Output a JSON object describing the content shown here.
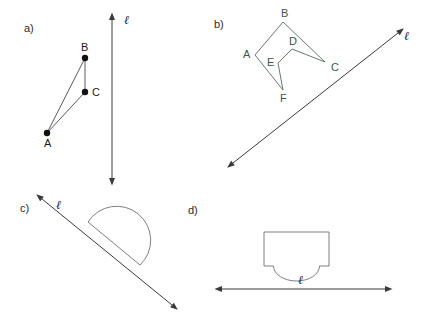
{
  "figure": {
    "background_color": "#ffffff",
    "width": 422,
    "height": 327
  },
  "panels": [
    {
      "id": "a",
      "label": "a)",
      "label_pos": [
        24,
        32
      ],
      "line": {
        "name": "line-ell-a",
        "label": "ℓ",
        "label_pos": [
          124,
          24
        ],
        "orientation": "vertical",
        "x1": 112,
        "y1": 20,
        "x2": 112,
        "y2": 178,
        "double_headed": true
      },
      "shape": {
        "name": "triangle-abc",
        "type": "triangle",
        "vertices": [
          {
            "name": "A",
            "x": 47,
            "y": 133,
            "label_dx": -3,
            "label_dy": 14
          },
          {
            "name": "B",
            "x": 85,
            "y": 58,
            "label_dx": -4,
            "label_dy": -7
          },
          {
            "name": "C",
            "x": 85,
            "y": 92,
            "label_dx": 7,
            "label_dy": 4
          }
        ],
        "edges": [
          [
            "A",
            "B"
          ],
          [
            "B",
            "C"
          ],
          [
            "C",
            "A"
          ]
        ],
        "dot_radius": 3.2
      }
    },
    {
      "id": "b",
      "label": "b)",
      "label_pos": [
        214,
        28
      ],
      "line": {
        "name": "line-ell-b",
        "label": "ℓ",
        "label_pos": [
          404,
          40
        ],
        "orientation": "diagonal-up-right",
        "x1": 233,
        "y1": 163,
        "x2": 398,
        "y2": 33,
        "double_headed": true
      },
      "shape": {
        "name": "hexagon-abcdef",
        "type": "concave-hexagon",
        "vertices": [
          {
            "name": "A",
            "x": 255,
            "y": 55,
            "label_dx": -12,
            "label_dy": 3
          },
          {
            "name": "B",
            "x": 283,
            "y": 22,
            "label_dx": -2,
            "label_dy": -5
          },
          {
            "name": "C",
            "x": 325,
            "y": 62,
            "label_dx": 6,
            "label_dy": 9
          },
          {
            "name": "D",
            "x": 292,
            "y": 49,
            "label_dx": -3,
            "label_dy": -4
          },
          {
            "name": "E",
            "x": 278,
            "y": 63,
            "label_dx": -11,
            "label_dy": 3
          },
          {
            "name": "F",
            "x": 283,
            "y": 90,
            "label_dx": -3,
            "label_dy": 12
          }
        ],
        "edges": [
          [
            "A",
            "B"
          ],
          [
            "B",
            "C"
          ],
          [
            "C",
            "D"
          ],
          [
            "D",
            "E"
          ],
          [
            "E",
            "F"
          ],
          [
            "F",
            "A"
          ]
        ]
      }
    },
    {
      "id": "c",
      "label": "c)",
      "label_pos": [
        20,
        208
      ],
      "line": {
        "name": "line-ell-c",
        "label": "ℓ",
        "label_pos": [
          56,
          207
        ],
        "orientation": "diagonal-down-right",
        "x1": 42,
        "y1": 199,
        "x2": 172,
        "y2": 305,
        "double_headed": true
      },
      "shape": {
        "name": "half-disk",
        "type": "semicircle",
        "diameter_start": [
          88,
          222
        ],
        "diameter_end": [
          140,
          265
        ],
        "bulge_side": "upper-right"
      }
    },
    {
      "id": "d",
      "label": "d)",
      "label_pos": [
        188,
        210
      ],
      "line": {
        "name": "line-ell-d",
        "label": "ℓ",
        "label_pos": [
          303,
          288
        ],
        "orientation": "horizontal",
        "x1": 222,
        "y1": 289,
        "x2": 385,
        "y2": 289,
        "double_headed": true
      },
      "shape": {
        "name": "notched-rectangle",
        "type": "rectangle-with-semicircular-notch",
        "left": 264,
        "right": 329,
        "top": 232,
        "bottom": 266,
        "notch_center_x": 296.5,
        "notch_half_width": 23,
        "notch_depth": 13
      }
    }
  ],
  "colors": {
    "stroke_default": "#555555",
    "stroke_shape": "#6b6f78",
    "stroke_panel_b": "#566b5c",
    "vertex_dot": "#111111",
    "text": "#1a1a1a",
    "background": "#ffffff"
  }
}
